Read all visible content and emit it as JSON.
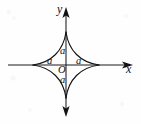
{
  "figure": {
    "kind": "astroid-curve-plot",
    "background_color": "#fefefe",
    "ink_color": "#141414",
    "canvas": {
      "width": 141,
      "height": 124
    }
  },
  "axes": {
    "x_axis": {
      "label": "x",
      "label_x": 127,
      "label_y": 64,
      "start_x": 8,
      "end_x": 133,
      "y": 65,
      "arrow_right": true,
      "arrow_left": false
    },
    "y_axis": {
      "label": "y",
      "label_x": 57,
      "label_y": 4,
      "x": 66,
      "start_y": 8,
      "end_y": 116,
      "arrow_up": true,
      "arrow_down": true
    },
    "origin": {
      "label": "O",
      "x": 66,
      "y": 65,
      "label_x": 59,
      "label_y": 66
    }
  },
  "curve": {
    "name": "astroid",
    "equation_family": "x^(2/3) + y^(2/3) = a^(2/3)",
    "center": {
      "x": 66,
      "y": 65
    },
    "radius_px": 33,
    "cusps": [
      {
        "name": "top-cusp",
        "x": 66,
        "y": 32
      },
      {
        "name": "right-cusp",
        "x": 99,
        "y": 65
      },
      {
        "name": "bottom-cusp",
        "x": 66,
        "y": 98
      },
      {
        "name": "left-cusp",
        "x": 33,
        "y": 65
      }
    ]
  },
  "labels": {
    "parameter": "a",
    "items": [
      {
        "name": "a-up",
        "text": "a",
        "x": 60,
        "y": 47
      },
      {
        "name": "a-left",
        "text": "a",
        "x": 47,
        "y": 57
      },
      {
        "name": "a-right",
        "text": "a",
        "x": 76,
        "y": 57
      },
      {
        "name": "a-down",
        "text": "a",
        "x": 60,
        "y": 76
      }
    ]
  }
}
